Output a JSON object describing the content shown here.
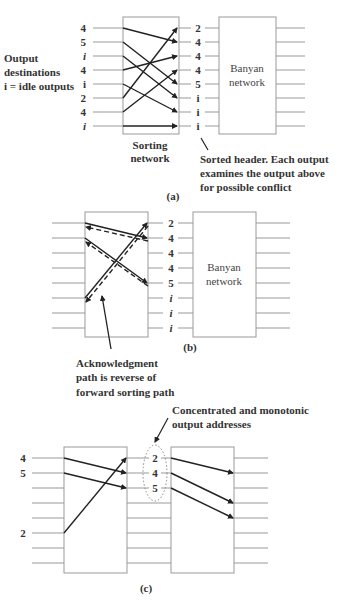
{
  "figure": {
    "panel_a": {
      "caption": "(a)",
      "side_label_lines": [
        "Output",
        "destinations",
        "i = idle outputs"
      ],
      "input_labels": [
        "4",
        "5",
        "i",
        "4",
        "i",
        "2",
        "4",
        "i"
      ],
      "input_italic": [
        false,
        false,
        true,
        false,
        false,
        false,
        false,
        true
      ],
      "sorting_box_label_lines": [
        "Sorting",
        "network"
      ],
      "output_labels": [
        "2",
        "4",
        "4",
        "4",
        "5",
        "i",
        "i",
        "i"
      ],
      "banyan_label_lines": [
        "Banyan",
        "network"
      ],
      "note_lines": [
        "Sorted header. Each output",
        "examines the output above",
        "for possible conflict"
      ],
      "routes": [
        [
          0,
          1
        ],
        [
          1,
          4
        ],
        [
          2,
          5
        ],
        [
          3,
          2
        ],
        [
          4,
          6
        ],
        [
          5,
          0
        ],
        [
          6,
          3
        ],
        [
          7,
          7
        ]
      ]
    },
    "panel_b": {
      "caption": "(b)",
      "output_labels": [
        "2",
        "4",
        "4",
        "4",
        "5",
        "i",
        "i",
        "i"
      ],
      "output_italic": [
        false,
        false,
        false,
        false,
        false,
        true,
        true,
        true
      ],
      "banyan_label_lines": [
        "Banyan",
        "network"
      ],
      "note_lines": [
        "Acknowledgment",
        "path is reverse of",
        "forward sorting path"
      ],
      "routes": [
        [
          0,
          1
        ],
        [
          1,
          4
        ],
        [
          5,
          0
        ]
      ]
    },
    "panel_c": {
      "caption": "(c)",
      "input_labels": {
        "0": "4",
        "1": "5",
        "5": "2"
      },
      "concentrated_labels": [
        "2",
        "4",
        "5"
      ],
      "note_lines": [
        "Concentrated and monotonic",
        "output addresses"
      ],
      "sort_routes": [
        [
          0,
          1
        ],
        [
          1,
          2
        ],
        [
          5,
          0
        ]
      ],
      "banyan_routes": [
        [
          0,
          1
        ],
        [
          1,
          3
        ],
        [
          2,
          4
        ]
      ]
    }
  }
}
